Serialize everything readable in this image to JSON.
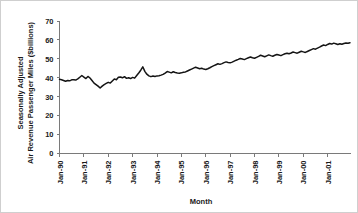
{
  "chart_data": {
    "type": "line",
    "title": "",
    "xlabel": "Month",
    "ylabel": "Seasonally Adjusted Air Revenue Passenger Miles ($billions)",
    "ylabel_line1": "Seasonally Adjusted",
    "ylabel_line2": "Air Revenue Passenger Miles ($billions)",
    "ylim": [
      0,
      70
    ],
    "yticks": [
      0,
      10,
      20,
      30,
      40,
      50,
      60,
      70
    ],
    "ytick_labels": [
      "0",
      "10",
      "20",
      "30",
      "40",
      "50",
      "60",
      "70"
    ],
    "xtick_labels": [
      "Jan-90",
      "Jan-91",
      "Jan-92",
      "Jan-93",
      "Jan-94",
      "Jan-95",
      "Jan-96",
      "Jan-97",
      "Jan-98",
      "Jan-99",
      "Jan-00",
      "Jan-01"
    ],
    "xtick_index": [
      0,
      12,
      24,
      36,
      48,
      60,
      72,
      84,
      96,
      108,
      120,
      132
    ],
    "x_start_label": "Jan-90",
    "x_end_label": "Dec-01",
    "grid": false,
    "legend": false,
    "legend_position": "none",
    "line_color": "#141414",
    "axis_color": "#7a7a7a",
    "background_color": "#ffffff",
    "n_points": 144,
    "series": [
      {
        "name": "Air Revenue Passenger Miles",
        "values": [
          39.2,
          39.0,
          38.6,
          38.2,
          38.6,
          38.4,
          38.9,
          39.0,
          38.8,
          39.4,
          40.3,
          41.2,
          40.4,
          39.6,
          40.7,
          39.9,
          38.6,
          37.2,
          36.4,
          35.6,
          34.6,
          35.6,
          36.4,
          37.0,
          37.6,
          37.2,
          38.3,
          39.4,
          39.0,
          40.3,
          40.4,
          40.0,
          40.6,
          39.7,
          40.0,
          39.6,
          40.2,
          39.8,
          41.2,
          42.5,
          44.0,
          45.8,
          43.4,
          41.9,
          41.0,
          40.6,
          40.9,
          40.7,
          41.0,
          41.1,
          41.4,
          41.8,
          42.5,
          43.3,
          43.0,
          42.6,
          43.2,
          42.8,
          42.5,
          42.4,
          42.6,
          42.9,
          43.1,
          43.6,
          44.1,
          44.6,
          45.1,
          45.6,
          45.2,
          44.8,
          45.0,
          44.6,
          44.4,
          44.8,
          45.3,
          45.9,
          46.4,
          46.9,
          47.4,
          47.1,
          47.5,
          48.0,
          48.4,
          48.1,
          47.9,
          48.3,
          48.8,
          49.3,
          49.7,
          50.2,
          49.9,
          49.6,
          50.1,
          50.6,
          51.0,
          50.6,
          50.3,
          50.8,
          51.3,
          51.9,
          51.5,
          51.1,
          51.6,
          52.1,
          51.7,
          51.4,
          51.9,
          52.3,
          52.0,
          51.7,
          52.2,
          52.7,
          53.0,
          52.7,
          53.1,
          53.6,
          53.3,
          53.0,
          53.5,
          54.0,
          53.7,
          53.4,
          53.9,
          54.4,
          54.9,
          55.4,
          55.1,
          55.7,
          56.2,
          56.8,
          57.3,
          57.0,
          57.6,
          58.1,
          57.8,
          58.3,
          58.0,
          57.6,
          58.0,
          57.7,
          58.1,
          58.4,
          58.2,
          58.5
        ]
      }
    ]
  },
  "figure": {
    "ytick_label_prefix": "",
    "source_note": ""
  }
}
